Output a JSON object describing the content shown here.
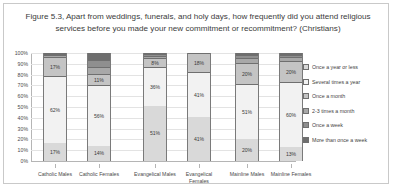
{
  "figure": {
    "title": "Figure 5.3, Apart from weddings, funerals, and holy days, how frequently did you attend religious services before you made your new commitment or recommitment? (Christians)"
  },
  "chart_data": {
    "type": "bar",
    "stacked": true,
    "stack_mode": "percent",
    "title": "Figure 5.3, Apart from weddings, funerals, and holy days, how frequently did you attend religious services before you made your new commitment or recommitment? (Christians)",
    "xlabel": "",
    "ylabel": "",
    "ylim": [
      0,
      100
    ],
    "grid": true,
    "legend_position": "right",
    "categories": [
      "Catholic Males",
      "Catholic Females",
      "Evangelical Males",
      "Evangelical Females",
      "Mainline Males",
      "Mainline Females"
    ],
    "ticks": [
      "0%",
      "10%",
      "20%",
      "30%",
      "40%",
      "50%",
      "60%",
      "70%",
      "80%",
      "90%",
      "100%"
    ],
    "series": [
      {
        "name": "Once a year or less",
        "color": "#d9d9d9",
        "values": [
          17,
          14,
          51,
          41,
          20,
          13
        ],
        "labels": [
          "17%",
          "14%",
          "51%",
          "41%",
          "20%",
          "13%"
        ]
      },
      {
        "name": "Several times a year",
        "color": "#f2f2f2",
        "values": [
          62,
          56,
          36,
          41,
          51,
          60
        ],
        "labels": [
          "62%",
          "56%",
          "36%",
          "41%",
          "51%",
          "60%"
        ]
      },
      {
        "name": "Once a month",
        "color": "#c4c4c4",
        "values": [
          17,
          11,
          8,
          18,
          20,
          20
        ],
        "labels": [
          "17%",
          "11%",
          "8%",
          "18%",
          "20%",
          "20%"
        ]
      },
      {
        "name": "2-3 times a month",
        "color": "#a8a8a8",
        "values": [
          2,
          6,
          2,
          0,
          4,
          3
        ],
        "labels": [
          "",
          "",
          "",
          "",
          "",
          ""
        ]
      },
      {
        "name": "Once a week",
        "color": "#8f8f8f",
        "values": [
          1,
          7,
          2,
          0,
          3,
          2
        ],
        "labels": [
          "",
          "",
          "",
          "",
          "",
          ""
        ]
      },
      {
        "name": "More than once a week",
        "color": "#6e6e6e",
        "values": [
          1,
          6,
          1,
          0,
          2,
          2
        ],
        "labels": [
          "",
          "",
          "",
          "",
          "",
          ""
        ]
      }
    ]
  }
}
